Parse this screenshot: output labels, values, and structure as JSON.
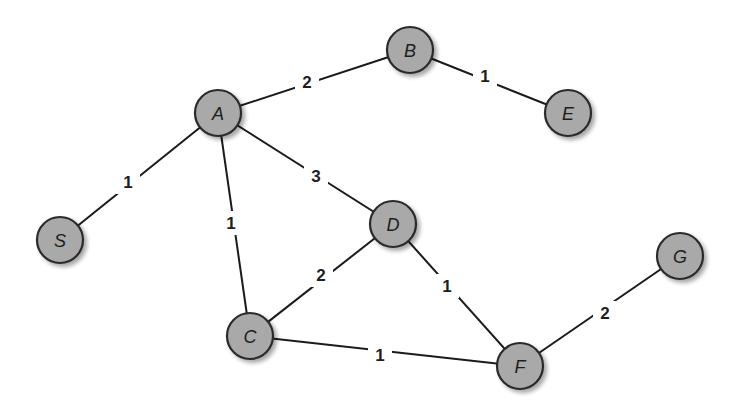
{
  "diagram": {
    "type": "weighted-undirected-graph",
    "node_radius": 23,
    "colors": {
      "node_fill": "#a9a9a9",
      "node_stroke": "#2a2a2a",
      "edge": "#1a1a1a",
      "text": "#1e1e1e",
      "background": "#ffffff"
    },
    "nodes": [
      {
        "id": "A",
        "label": "A",
        "x": 218,
        "y": 113
      },
      {
        "id": "B",
        "label": "B",
        "x": 410,
        "y": 50
      },
      {
        "id": "E",
        "label": "E",
        "x": 568,
        "y": 113
      },
      {
        "id": "S",
        "label": "S",
        "x": 60,
        "y": 240
      },
      {
        "id": "D",
        "label": "D",
        "x": 393,
        "y": 224
      },
      {
        "id": "C",
        "label": "C",
        "x": 250,
        "y": 336
      },
      {
        "id": "F",
        "label": "F",
        "x": 520,
        "y": 366
      },
      {
        "id": "G",
        "label": "G",
        "x": 680,
        "y": 256
      }
    ],
    "edges": [
      {
        "from": "A",
        "to": "B",
        "weight": "2",
        "lx": 307,
        "ly": 82
      },
      {
        "from": "B",
        "to": "E",
        "weight": "1",
        "lx": 485,
        "ly": 76
      },
      {
        "from": "A",
        "to": "S",
        "weight": "1",
        "lx": 128,
        "ly": 182
      },
      {
        "from": "A",
        "to": "D",
        "weight": "3",
        "lx": 316,
        "ly": 176
      },
      {
        "from": "A",
        "to": "C",
        "weight": "1",
        "lx": 231,
        "ly": 223
      },
      {
        "from": "C",
        "to": "D",
        "weight": "2",
        "lx": 321,
        "ly": 275
      },
      {
        "from": "D",
        "to": "F",
        "weight": "1",
        "lx": 447,
        "ly": 286
      },
      {
        "from": "C",
        "to": "F",
        "weight": "1",
        "lx": 380,
        "ly": 355
      },
      {
        "from": "F",
        "to": "G",
        "weight": "2",
        "lx": 605,
        "ly": 313
      }
    ]
  }
}
